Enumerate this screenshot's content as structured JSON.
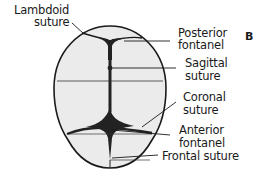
{
  "figure": {
    "panel_label": "B",
    "labels": {
      "lambdoid_suture": [
        "Lambdoid",
        "suture"
      ],
      "posterior_fontanel": [
        "Posterior",
        "fontanel"
      ],
      "sagittal_suture": [
        "Sagittal",
        "suture"
      ],
      "coronal_suture": [
        "Coronal",
        "suture"
      ],
      "anterior_fontanel": [
        "Anterior",
        "fontanel"
      ],
      "frontal_suture": [
        "Frontal suture"
      ]
    },
    "colors": {
      "skull_fill": "#ebebeb",
      "outline": "#1a1a1a",
      "fontanel": "#222222"
    }
  }
}
